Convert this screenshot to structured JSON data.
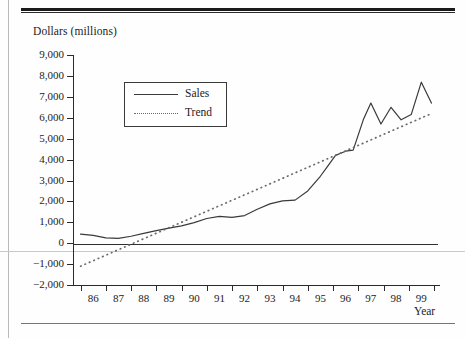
{
  "page": {
    "header_ghost": "",
    "background": "#fefefe",
    "rule_color": "#1a1a1a"
  },
  "chart_data": {
    "type": "line",
    "title": "",
    "xlabel": "Year",
    "ylabel": "Dollars (millions)",
    "ylim": [
      -2000,
      9000
    ],
    "ytick_labels": [
      "9,000",
      "8,000",
      "7,000",
      "6,000",
      "5,000",
      "4,000",
      "3,000",
      "2,000",
      "1,000",
      "0",
      "−1,000",
      "−2,000"
    ],
    "ytick_values": [
      9000,
      8000,
      7000,
      6000,
      5000,
      4000,
      3000,
      2000,
      1000,
      0,
      -1000,
      -2000
    ],
    "categories": [
      "86",
      "87",
      "88",
      "89",
      "90",
      "91",
      "92",
      "93",
      "94",
      "95",
      "96",
      "97",
      "98",
      "99"
    ],
    "grid": false,
    "legend_position": "upper-left-inset",
    "zero_line": true,
    "series": [
      {
        "name": "Sales",
        "style": "solid",
        "color": "#3a3a3a",
        "x": [
          85.5,
          86.0,
          86.5,
          87.0,
          87.5,
          88.0,
          88.5,
          89.0,
          89.5,
          90.0,
          90.5,
          91.0,
          91.5,
          92.0,
          92.5,
          93.0,
          93.5,
          94.0,
          94.5,
          95.0,
          95.3,
          95.6,
          96.0,
          96.3,
          96.7,
          97.0,
          97.4,
          97.8,
          98.2,
          98.6,
          99.0,
          99.4
        ],
        "values": [
          430,
          370,
          250,
          230,
          330,
          470,
          600,
          720,
          830,
          980,
          1180,
          1280,
          1230,
          1320,
          1620,
          1880,
          2020,
          2060,
          2500,
          3200,
          3700,
          4200,
          4400,
          4450,
          5900,
          6700,
          5700,
          6500,
          5900,
          6150,
          7700,
          6700
        ]
      },
      {
        "name": "Trend",
        "style": "dotted",
        "color": "#6a6a6a",
        "x": [
          85.5,
          99.4
        ],
        "values": [
          -1100,
          6200
        ]
      }
    ]
  },
  "legend": {
    "items": [
      {
        "label": "Sales",
        "style": "solid"
      },
      {
        "label": "Trend",
        "style": "dotted"
      }
    ]
  }
}
